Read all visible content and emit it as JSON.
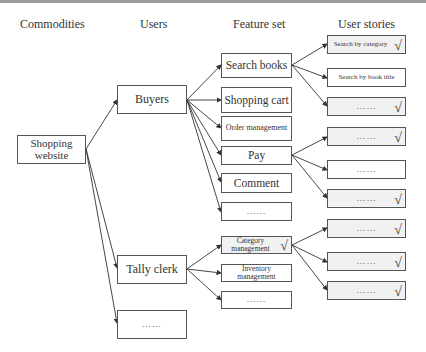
{
  "headers": {
    "commodities": "Commodities",
    "users": "Users",
    "feature_set": "Feature set",
    "user_stories": "User stories"
  },
  "commodity": {
    "label": "Shopping website"
  },
  "users": [
    {
      "id": "buyers",
      "label": "Buyers"
    },
    {
      "id": "tally-clerk",
      "label": "Tally clerk"
    },
    {
      "id": "more-users",
      "label": "……"
    }
  ],
  "features": [
    {
      "id": "search-books",
      "label": "Search books",
      "parent": "buyers",
      "checked": false
    },
    {
      "id": "shopping-cart",
      "label": "Shopping cart",
      "parent": "buyers",
      "checked": false
    },
    {
      "id": "order-management",
      "label": "Order management",
      "parent": "buyers",
      "checked": false
    },
    {
      "id": "pay",
      "label": "Pay",
      "parent": "buyers",
      "checked": false
    },
    {
      "id": "comment",
      "label": "Comment",
      "parent": "buyers",
      "checked": false
    },
    {
      "id": "more-buyer-features",
      "label": "……",
      "parent": "buyers",
      "checked": false
    },
    {
      "id": "category-management",
      "label": "Category management",
      "parent": "tally-clerk",
      "checked": true
    },
    {
      "id": "inventory-management",
      "label": "Inventory management",
      "parent": "tally-clerk",
      "checked": false
    },
    {
      "id": "more-clerk-features",
      "label": "……",
      "parent": "tally-clerk",
      "checked": false
    }
  ],
  "user_stories": [
    {
      "label": "Search by category",
      "parent": "search-books",
      "checked": true
    },
    {
      "label": "Search by book title",
      "parent": "search-books",
      "checked": false
    },
    {
      "label": "……",
      "parent": "search-books",
      "checked": true
    },
    {
      "label": "……",
      "parent": "pay",
      "checked": true
    },
    {
      "label": "……",
      "parent": "pay",
      "checked": false
    },
    {
      "label": "……",
      "parent": "pay",
      "checked": true
    },
    {
      "label": "……",
      "parent": "category-management",
      "checked": true
    },
    {
      "label": "……",
      "parent": "category-management",
      "checked": true
    },
    {
      "label": "……",
      "parent": "category-management",
      "checked": true
    }
  ],
  "check_glyph": "√",
  "colors": {
    "border": "#555555",
    "checked_fill": "#f1f1f1",
    "top_rule": "#9a9a9a"
  }
}
